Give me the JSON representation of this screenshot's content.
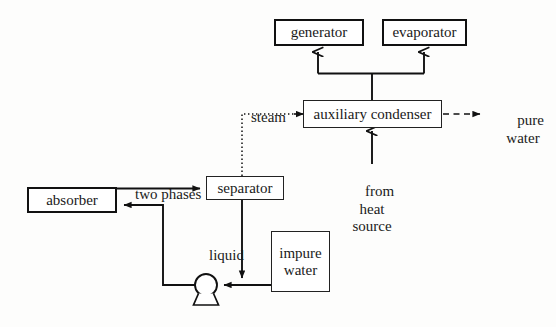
{
  "diagram": {
    "background_color": "#fdfdfc",
    "line_color": "#111111",
    "text_color": "#1a1a1a",
    "nodes": [
      {
        "id": "generator",
        "label": "generator",
        "style": "thick",
        "x": 274,
        "y": 19,
        "w": 90,
        "h": 27
      },
      {
        "id": "evaporator",
        "label": "evaporator",
        "style": "thick",
        "x": 382,
        "y": 19,
        "w": 85,
        "h": 27
      },
      {
        "id": "auxiliary-condenser",
        "label": "auxiliary condenser",
        "style": "thin",
        "x": 303,
        "y": 100,
        "w": 139,
        "h": 28
      },
      {
        "id": "separator",
        "label": "separator",
        "style": "thin",
        "x": 206,
        "y": 176,
        "w": 78,
        "h": 24
      },
      {
        "id": "absorber",
        "label": "absorber",
        "style": "thick",
        "x": 27,
        "y": 187,
        "w": 90,
        "h": 26
      },
      {
        "id": "impure-water",
        "label": "impure\nwater",
        "style": "thin",
        "x": 271,
        "y": 231,
        "w": 59,
        "h": 61
      }
    ],
    "edge_labels": [
      {
        "id": "steam",
        "text": "steam",
        "x": 236,
        "y": 93,
        "w": 46,
        "align": "left"
      },
      {
        "id": "pure-water",
        "text": "pure\nwater",
        "x": 496,
        "y": 96,
        "w": 54,
        "align": "center"
      },
      {
        "id": "two-phases",
        "text": "two phases",
        "x": 123,
        "y": 170,
        "w": 72,
        "align": "center"
      },
      {
        "id": "from-heat-source",
        "text": "from\nheat\nsource",
        "x": 344,
        "y": 167,
        "w": 58,
        "align": "center"
      },
      {
        "id": "liquid",
        "text": "liquid",
        "x": 196,
        "y": 231,
        "w": 40,
        "align": "center"
      }
    ],
    "connectors": [
      {
        "id": "condenser-to-manifold",
        "type": "solid",
        "from": "auxiliary-condenser",
        "to": "manifold"
      },
      {
        "id": "manifold-to-generator",
        "type": "arrow",
        "from": "manifold",
        "to": "generator"
      },
      {
        "id": "manifold-to-evaporator",
        "type": "arrow",
        "from": "manifold",
        "to": "evaporator"
      },
      {
        "id": "separator-steam-to-condenser",
        "type": "dotted-arrow",
        "from": "separator",
        "to": "auxiliary-condenser"
      },
      {
        "id": "condenser-to-pure-water",
        "type": "dashed-arrow",
        "from": "auxiliary-condenser",
        "to": "pure-water"
      },
      {
        "id": "heat-source-to-condenser",
        "type": "arrow",
        "from": "heat-source",
        "to": "auxiliary-condenser"
      },
      {
        "id": "absorber-to-separator",
        "type": "arrow",
        "from": "absorber",
        "to": "separator"
      },
      {
        "id": "separator-liquid-to-pump",
        "type": "arrow",
        "from": "separator",
        "to": "pump"
      },
      {
        "id": "impure-water-to-pump",
        "type": "arrow",
        "from": "impure-water",
        "to": "pump"
      },
      {
        "id": "pump-to-absorber",
        "type": "arrow",
        "from": "pump",
        "to": "absorber"
      }
    ],
    "pump": {
      "id": "pump",
      "shape": "circle-with-base",
      "cx": 206,
      "cy": 285,
      "r": 11
    }
  }
}
